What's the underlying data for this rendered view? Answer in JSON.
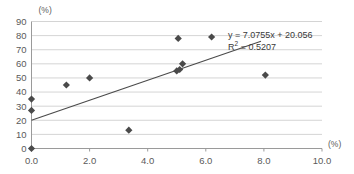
{
  "chart_data": {
    "type": "scatter",
    "title": "",
    "subtitle": "",
    "xlabel": "(%)",
    "ylabel": "(%)",
    "xlim": [
      0.0,
      10.0
    ],
    "ylim": [
      0,
      90
    ],
    "xticks": [
      "0.0",
      "2.0",
      "4.0",
      "6.0",
      "8.0",
      "10.0"
    ],
    "xtick_values": [
      0.0,
      2.0,
      4.0,
      6.0,
      8.0,
      10.0
    ],
    "yticks": [
      "0",
      "10",
      "20",
      "30",
      "40",
      "50",
      "60",
      "70",
      "80",
      "90"
    ],
    "ytick_values": [
      0,
      10,
      20,
      30,
      40,
      50,
      60,
      70,
      80,
      90
    ],
    "grid": "horizontal",
    "legend": "none",
    "marker": "diamond",
    "marker_color": "#4a4a4a",
    "points": [
      {
        "x": 0.0,
        "y": 35
      },
      {
        "x": 0.0,
        "y": 27
      },
      {
        "x": 0.0,
        "y": 0
      },
      {
        "x": 1.2,
        "y": 45
      },
      {
        "x": 2.0,
        "y": 50
      },
      {
        "x": 3.35,
        "y": 13
      },
      {
        "x": 5.0,
        "y": 55
      },
      {
        "x": 5.05,
        "y": 78
      },
      {
        "x": 5.1,
        "y": 56
      },
      {
        "x": 5.2,
        "y": 60
      },
      {
        "x": 6.2,
        "y": 79
      },
      {
        "x": 8.05,
        "y": 52
      }
    ],
    "trendline": {
      "slope": 7.0755,
      "intercept": 20.056,
      "x_start": 0.0,
      "x_end": 7.9,
      "color": "#4a4a4a"
    },
    "annotations": {
      "equation": "y = 7.0755x + 20.056",
      "r_squared_label": "R",
      "r_squared_exponent": "2",
      "r_squared_value": "= 0.5207",
      "r_squared_full": "R² = 0.5207"
    }
  },
  "colors": {
    "grid": "#c9c9c9",
    "axis": "#9a9a9a",
    "marker": "#4a4a4a",
    "trendline": "#4a4a4a",
    "text": "#5a5a5a",
    "annotation_text": "#3a3a3a",
    "background": "#ffffff"
  }
}
